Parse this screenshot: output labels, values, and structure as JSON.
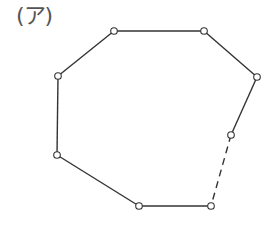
{
  "figure": {
    "label": "(ア)",
    "stroke_color": "#333333",
    "vertex_fill": "#ffffff",
    "vertices": [
      {
        "id": "v1",
        "x": 114,
        "y": 31
      },
      {
        "id": "v2",
        "x": 204,
        "y": 31
      },
      {
        "id": "v3",
        "x": 257,
        "y": 77
      },
      {
        "id": "v4",
        "x": 231,
        "y": 135
      },
      {
        "id": "v5",
        "x": 211,
        "y": 206
      },
      {
        "id": "v6",
        "x": 139,
        "y": 206
      },
      {
        "id": "v7",
        "x": 57,
        "y": 155
      },
      {
        "id": "v8",
        "x": 58,
        "y": 76
      }
    ],
    "edges": [
      {
        "from": "v1",
        "to": "v2",
        "style": "solid"
      },
      {
        "from": "v2",
        "to": "v3",
        "style": "solid"
      },
      {
        "from": "v3",
        "to": "v4",
        "style": "solid"
      },
      {
        "from": "v4",
        "to": "v5",
        "style": "dashed"
      },
      {
        "from": "v5",
        "to": "v6",
        "style": "solid"
      },
      {
        "from": "v6",
        "to": "v7",
        "style": "solid"
      },
      {
        "from": "v7",
        "to": "v8",
        "style": "solid"
      },
      {
        "from": "v8",
        "to": "v1",
        "style": "solid"
      }
    ]
  }
}
